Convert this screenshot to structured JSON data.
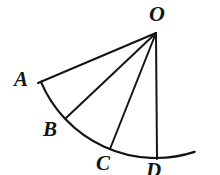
{
  "figure": {
    "type": "geometry-diagram",
    "canvas": {
      "width": 220,
      "height": 175
    },
    "colors": {
      "background": "#ffffff",
      "stroke": "#141414",
      "label": "#141414"
    },
    "arc": {
      "name": "circular-arc",
      "center": {
        "x": 156,
        "y": 33
      },
      "radius": 125,
      "start_angle_deg": 157,
      "end_angle_deg": 72,
      "start_point": {
        "x": 41,
        "y": 82
      },
      "end_point": {
        "x": 220,
        "y": 152
      },
      "stroke_width": 2.2
    },
    "vertex": {
      "name": "O",
      "label": "O",
      "point": {
        "x": 156,
        "y": 33
      },
      "label_pos": {
        "x": 149,
        "y": 3
      }
    },
    "radii": [
      {
        "name": "OA",
        "from": {
          "x": 156,
          "y": 33
        },
        "to": {
          "x": 38,
          "y": 83
        },
        "stroke_width": 2.0
      },
      {
        "name": "OB",
        "from": {
          "x": 156,
          "y": 33
        },
        "to": {
          "x": 66,
          "y": 118
        },
        "stroke_width": 2.0
      },
      {
        "name": "OC",
        "from": {
          "x": 156,
          "y": 33
        },
        "to": {
          "x": 110,
          "y": 149
        },
        "stroke_width": 2.0
      },
      {
        "name": "OD",
        "from": {
          "x": 156,
          "y": 33
        },
        "to": {
          "x": 157,
          "y": 159
        },
        "stroke_width": 2.0
      }
    ],
    "points": [
      {
        "name": "A",
        "label": "A",
        "point": {
          "x": 38,
          "y": 83
        },
        "label_pos": {
          "x": 14,
          "y": 69
        },
        "font_size": 21
      },
      {
        "name": "B",
        "label": "B",
        "point": {
          "x": 66,
          "y": 118
        },
        "label_pos": {
          "x": 43,
          "y": 119
        },
        "font_size": 21
      },
      {
        "name": "C",
        "label": "C",
        "point": {
          "x": 110,
          "y": 149
        },
        "label_pos": {
          "x": 96,
          "y": 153
        },
        "font_size": 21
      },
      {
        "name": "D",
        "label": "D",
        "point": {
          "x": 157,
          "y": 159
        },
        "label_pos": {
          "x": 146,
          "y": 160
        },
        "font_size": 21
      }
    ],
    "vertex_font_size": 22
  }
}
